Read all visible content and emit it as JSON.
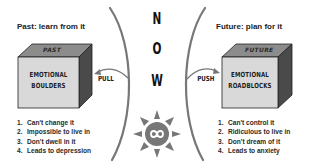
{
  "left": {
    "heading": "Past: learn from it",
    "cube": {
      "top_label": "PAST",
      "line1": "EMOTIONAL",
      "line2": "BOULDERS"
    },
    "arrow_label": "PULL",
    "list": [
      {
        "num": "1.",
        "text": "Can't change it"
      },
      {
        "num": "2.",
        "text": "Impossible to live in"
      },
      {
        "num": "3.",
        "text": "Don't dwell in it"
      },
      {
        "num": "4.",
        "text": "Leads to depression"
      }
    ]
  },
  "center": {
    "letters": [
      "N",
      "O",
      "W"
    ],
    "icon": "sun-infinity-icon"
  },
  "right": {
    "heading": "Future: plan for it",
    "cube": {
      "top_label": "FUTURE",
      "line1": "EMOTIONAL",
      "line2": "ROADBLOCKS"
    },
    "arrow_label": "PUSH",
    "list": [
      {
        "num": "1.",
        "text": "Can't control it"
      },
      {
        "num": "2.",
        "text": "Ridiculous to live in"
      },
      {
        "num": "3.",
        "text": "Don't dream of it"
      },
      {
        "num": "4.",
        "text": "Leads to anxiety"
      }
    ]
  },
  "colors": {
    "cube_front": "#d9d9d9",
    "cube_top": "#8c8c8c",
    "cube_side": "#4a4a4a",
    "arc": "#777777",
    "sun": "#777777"
  }
}
